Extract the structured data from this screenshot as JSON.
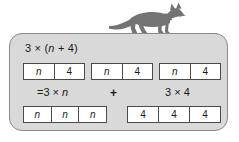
{
  "figure": {
    "topic": "distributive-property-bar-model",
    "panel_fill": "#d9d9d9",
    "panel_border": "#8a8a8a",
    "box_fill": "#ffffff",
    "box_border": "#4a4a4a",
    "fox_color": "#737373",
    "background": "#ffffff"
  },
  "illustration": {
    "animal": "fox-silhouette",
    "direction": "facing-right"
  },
  "expression": {
    "prefix": "3 × (",
    "variable": "n",
    "suffix": " + 4)",
    "full": "3 × (n + 4)"
  },
  "top_row": {
    "groups": [
      {
        "cells": [
          "n",
          "4"
        ]
      },
      {
        "cells": [
          "n",
          "4"
        ]
      },
      {
        "cells": [
          "n",
          "4"
        ]
      }
    ]
  },
  "equation": {
    "left_equals": "=",
    "left_term_prefix": "3 × ",
    "left_term_variable": "n",
    "left_full": "= 3 × n",
    "operator": "+",
    "right_full": "3 × 4"
  },
  "bottom_row": {
    "groups": [
      {
        "cells": [
          "n",
          "n",
          "n"
        ]
      },
      {
        "cells": [
          "4",
          "4",
          "4"
        ]
      }
    ]
  }
}
